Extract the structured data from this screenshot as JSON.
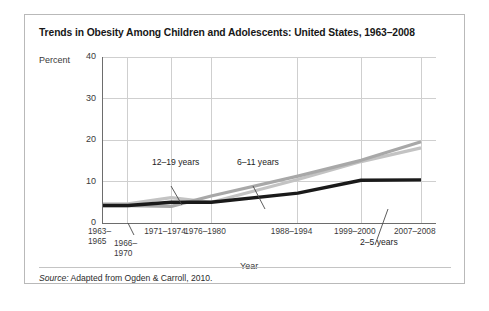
{
  "figure": {
    "title": "Trends in Obesity Among Children and Adolescents: United States, 1963–2008",
    "source_prefix": "Source:",
    "source_text": " Adapted from Ogden & Carroll, 2010."
  },
  "colors": {
    "frame": "#b9b9b9",
    "axis": "#6d6d6d",
    "grid": "#cfcfcf",
    "text": "#2b2b2b",
    "series_6_11": "#a8a8a8",
    "series_12_19": "#c3c3c3",
    "series_2_5": "#1a1a1a",
    "leader": "#4a4a4a"
  },
  "chart_data": {
    "type": "line",
    "title": "Trends in Obesity Among Children and Adolescents: United States, 1963–2008",
    "xlabel": "Year",
    "ylabel": "Percent",
    "ylim": [
      0,
      40
    ],
    "yticks": [
      0,
      10,
      20,
      30,
      40
    ],
    "ytick_labels": [
      "0",
      "10",
      "20",
      "30",
      "40"
    ],
    "grid": true,
    "legend": "inline-annotations",
    "categories": [
      "1963–1965",
      "1966–1970",
      "1971–1974",
      "1976–1980",
      "1988–1994",
      "1999–2000",
      "2007–2008"
    ],
    "xtick_labels": [
      "1963–\n1965",
      "1966–\n1970",
      "1971–1974",
      "1976–1980",
      "1988–1994",
      "1999–2000",
      "2007–2008"
    ],
    "series": [
      {
        "name": "6–11 years",
        "color": "#a8a8a8",
        "values": [
          4.2,
          4.2,
          4.0,
          6.5,
          11.3,
          15.1,
          19.6
        ]
      },
      {
        "name": "12–19 years",
        "color": "#c3c3c3",
        "values": [
          4.6,
          4.6,
          6.1,
          5.0,
          10.5,
          14.8,
          18.1
        ]
      },
      {
        "name": "2–5 years",
        "color": "#1a1a1a",
        "values": [
          4.2,
          4.2,
          5.0,
          5.0,
          7.2,
          10.3,
          10.4
        ]
      }
    ],
    "annotations": [
      {
        "text": "12–19 years",
        "target_category": "1971–1974"
      },
      {
        "text": "6–11 years",
        "target_category": "1976–1980"
      },
      {
        "text": "2–5 years",
        "target_category": "1999–2000"
      }
    ]
  }
}
